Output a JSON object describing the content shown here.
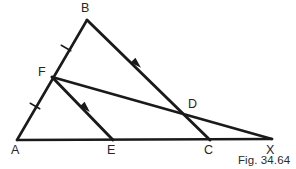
{
  "figure": {
    "caption": "Fig. 34.64",
    "stroke_color": "#1a1a1a",
    "label_color": "#262626",
    "background_color": "#ffffff",
    "points": {
      "A": {
        "label": "A",
        "x": 17,
        "y": 140,
        "label_x": 11,
        "label_y": 144
      },
      "B": {
        "label": "B",
        "x": 87,
        "y": 20,
        "label_x": 81,
        "label_y": 2
      },
      "C": {
        "label": "C",
        "x": 210,
        "y": 140,
        "label_x": 204,
        "label_y": 144
      },
      "D": {
        "label": "D",
        "x": 186,
        "y": 112,
        "label_x": 188,
        "label_y": 98
      },
      "E": {
        "label": "E",
        "x": 113,
        "y": 140,
        "label_x": 107,
        "label_y": 144
      },
      "F": {
        "label": "F",
        "x": 52,
        "y": 77,
        "label_x": 38,
        "label_y": 66
      },
      "X": {
        "label": "X",
        "x": 272,
        "y": 139,
        "label_x": 266,
        "label_y": 144
      }
    },
    "segments": [
      {
        "name": "segment-AB",
        "from": "A",
        "to": "B"
      },
      {
        "name": "segment-AX",
        "from": "A",
        "to": "X"
      },
      {
        "name": "segment-BC",
        "from": "B",
        "to": "C"
      },
      {
        "name": "segment-FX",
        "from": "F",
        "to": "X"
      },
      {
        "name": "segment-FE",
        "from": "F",
        "to": "E"
      }
    ],
    "tick_marks": [
      {
        "name": "tick-AF",
        "x": 35,
        "y": 106,
        "note": "equal-length mark on AF"
      },
      {
        "name": "tick-FB",
        "x": 66,
        "y": 48,
        "note": "equal-length mark on FB"
      }
    ],
    "arrow_marks": [
      {
        "name": "arrow-BC",
        "x": 137,
        "y": 64,
        "note": "parallel mark on BC"
      },
      {
        "name": "arrow-FE",
        "x": 86,
        "y": 108,
        "note": "parallel mark on FE"
      }
    ]
  }
}
